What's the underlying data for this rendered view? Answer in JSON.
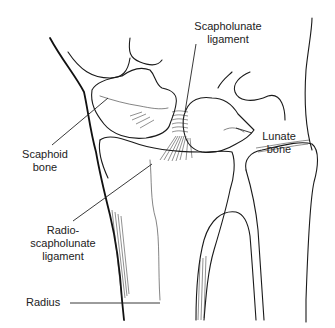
{
  "figure": {
    "line_color": "#1a1a1a",
    "background": "#ffffff"
  },
  "labels": {
    "scapholunate_ligament": {
      "line1": "Scapholunate",
      "line2": "ligament"
    },
    "scaphoid_bone": {
      "line1": "Scaphoid",
      "line2": "bone"
    },
    "lunate_bone": {
      "line1": "Lunate",
      "line2": "bone"
    },
    "radioscapholunate_ligament": {
      "line1": "Radio-",
      "line2": "scapholunate",
      "line3": "ligament"
    },
    "radius": {
      "line1": "Radius"
    }
  }
}
